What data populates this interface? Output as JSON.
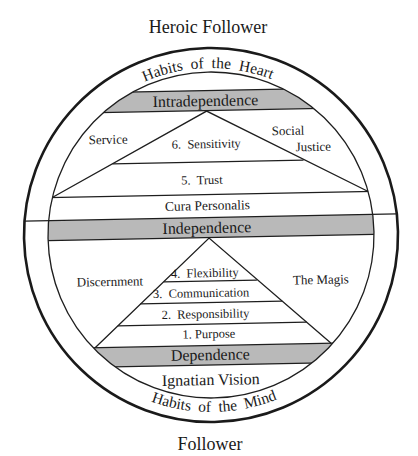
{
  "diagram": {
    "top_title": "Heroic Follower",
    "bottom_title": "Follower",
    "arcs": {
      "top": "Habits  of  the  Heart",
      "bottom": "Habits  of  the  Mind"
    },
    "bands": {
      "top": "Intradependence",
      "middle": "Independence",
      "bottom": "Dependence"
    },
    "upper_section": {
      "left_label": "Service",
      "right_label_line1": "Social",
      "right_label_line2": "Justice",
      "levels": [
        {
          "label": "6.  Sensitivity"
        },
        {
          "label": "5.  Trust"
        }
      ],
      "base_label": "Cura Personalis"
    },
    "lower_section": {
      "left_label": "Discernment",
      "right_label": "The Magis",
      "levels": [
        {
          "label": "4.  Flexibility"
        },
        {
          "label": "3.  Communication"
        },
        {
          "label": "2.  Responsibility"
        },
        {
          "label": "1. Purpose"
        }
      ],
      "base_label": "Ignatian Vision"
    },
    "colors": {
      "band_fill": "#b9b9b9",
      "stroke": "#1e1e1e"
    }
  }
}
